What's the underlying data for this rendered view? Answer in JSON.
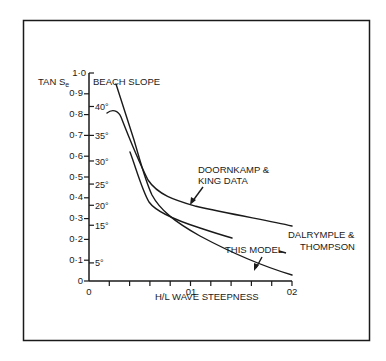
{
  "chart_data": {
    "type": "line",
    "title": "",
    "xlabel": "H/L  WAVE STEEPNESS",
    "ylabel": "TAN Se",
    "ylabel_secondary": "BEACH SLOPE",
    "xlim": [
      0,
      0.2
    ],
    "ylim": [
      0,
      1.0
    ],
    "x_ticks": [
      0,
      0.01,
      0.02,
      0.03,
      0.04,
      0.05,
      0.06,
      0.07,
      0.08,
      0.09,
      0.1,
      0.11,
      0.12,
      0.13,
      0.14,
      0.15,
      0.16,
      0.17,
      0.18,
      0.19,
      0.2
    ],
    "x_tick_labels": [
      {
        "value": 0,
        "label": "0"
      },
      {
        "value": 0.1,
        "label": "01"
      },
      {
        "value": 0.2,
        "label": "02"
      }
    ],
    "y_tick_labels": [
      {
        "value": 0,
        "label": "0"
      },
      {
        "value": 0.1,
        "label": "0·1"
      },
      {
        "value": 0.2,
        "label": "0·2"
      },
      {
        "value": 0.3,
        "label": "0·3"
      },
      {
        "value": 0.4,
        "label": "0·4"
      },
      {
        "value": 0.5,
        "label": "0·5"
      },
      {
        "value": 0.6,
        "label": "0·6"
      },
      {
        "value": 0.7,
        "label": "0·7"
      },
      {
        "value": 0.8,
        "label": "0·8"
      },
      {
        "value": 0.9,
        "label": "0·9"
      },
      {
        "value": 1.0,
        "label": "1·0"
      }
    ],
    "angle_labels": [
      {
        "tan": 0.087,
        "label": "5°"
      },
      {
        "tan": 0.268,
        "label": "15°"
      },
      {
        "tan": 0.364,
        "label": "20°"
      },
      {
        "tan": 0.466,
        "label": "25°"
      },
      {
        "tan": 0.577,
        "label": "30°"
      },
      {
        "tan": 0.7,
        "label": "35°"
      },
      {
        "tan": 0.839,
        "label": "40°"
      }
    ],
    "grid": false,
    "legend": "inline annotations",
    "series": [
      {
        "name": "DOORNKAMP & KING DATA",
        "x": [
          0.018,
          0.022,
          0.027,
          0.035,
          0.045,
          0.055,
          0.07,
          0.1,
          0.15,
          0.2
        ],
        "y": [
          0.805,
          0.81,
          0.79,
          0.67,
          0.5,
          0.44,
          0.4,
          0.36,
          0.31,
          0.27
        ]
      },
      {
        "name": "DALRYMPLE & THOMPSON",
        "x": [
          0.04,
          0.045,
          0.05,
          0.06,
          0.07,
          0.1,
          0.14
        ],
        "y": [
          0.62,
          0.52,
          0.42,
          0.37,
          0.34,
          0.28,
          0.21
        ]
      },
      {
        "name": "THIS MODEL",
        "x": [
          0.027,
          0.035,
          0.045,
          0.055,
          0.065,
          0.08,
          0.1,
          0.13,
          0.16,
          0.2
        ],
        "y": [
          0.94,
          0.78,
          0.56,
          0.4,
          0.32,
          0.26,
          0.2,
          0.13,
          0.08,
          0.03
        ]
      }
    ],
    "annotations": [
      {
        "text_lines": [
          "DOORNKAMP &",
          "KING DATA"
        ],
        "target_series": "DOORNKAMP & KING DATA"
      },
      {
        "text_lines": [
          "DALRYMPLE &",
          "THOMPSON"
        ],
        "target_series": "DALRYMPLE & THOMPSON"
      },
      {
        "text_lines": [
          "THIS MODEL"
        ],
        "target_series": "THIS MODEL"
      }
    ]
  },
  "labels": {
    "y_title_main": "TAN S",
    "y_title_sub": "e",
    "beach_slope": "BEACH SLOPE",
    "x_title": "H/L  WAVE STEEPNESS",
    "doorn_1": "DOORNKAMP &",
    "doorn_2": "KING DATA",
    "dal_1": "DALRYMPLE &",
    "dal_2": "THOMPSON",
    "model": "THIS MODEL",
    "x0": "0",
    "x1": "01",
    "x2": "02",
    "y0": "0",
    "y1": "0·1",
    "y2": "0·2",
    "y3": "0·3",
    "y4": "0·4",
    "y5": "0·5",
    "y6": "0·6",
    "y7": "0·7",
    "y8": "0·8",
    "y9": "0·9",
    "y10": "1·0",
    "a5": "5°",
    "a15": "15°",
    "a20": "20°",
    "a25": "25°",
    "a30": "30°",
    "a35": "35°",
    "a40": "40°"
  },
  "colors": {
    "ink": "#1a1a1a",
    "background": "#ffffff"
  }
}
